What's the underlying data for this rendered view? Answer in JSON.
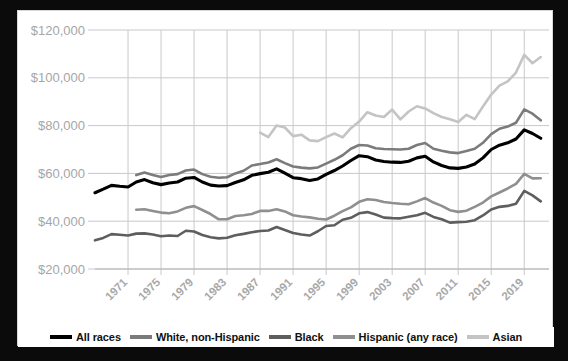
{
  "theme": {
    "page_background": "#0b0b0b",
    "card_background": "#ffffff",
    "grid_color": "#c9c9c9",
    "axis_label_color": "#a6a6a6"
  },
  "legend": {
    "position": "bottom",
    "items": [
      {
        "label": "All races",
        "color": "#000000",
        "swatch": "legend-swatch-all-races"
      },
      {
        "label": "White, non-Hispanic",
        "color": "#7b7b7b",
        "swatch": "legend-swatch-white"
      },
      {
        "label": "Black",
        "color": "#5e5e5e",
        "swatch": "legend-swatch-black"
      },
      {
        "label": "Hispanic (any race)",
        "color": "#8f8f8f",
        "swatch": "legend-swatch-hispanic"
      },
      {
        "label": "Asian",
        "color": "#c4c4c4",
        "swatch": "legend-swatch-asian"
      }
    ]
  },
  "chart_data": {
    "type": "line",
    "title": "",
    "subtitle": "",
    "xlabel": "",
    "ylabel": "",
    "grid": true,
    "legend_position": "bottom",
    "xlim": [
      1967,
      2022
    ],
    "ylim": [
      20000,
      120000
    ],
    "ytick_labels": [
      "$120,000",
      "$100,000",
      "$80,000",
      "$60,000",
      "$40,000",
      "$20,000"
    ],
    "ytick_values": [
      120000,
      100000,
      80000,
      60000,
      40000,
      20000
    ],
    "xtick_labels": [
      "1971",
      "1975",
      "1979",
      "1983",
      "1987",
      "1991",
      "1995",
      "1999",
      "2003",
      "2007",
      "2011",
      "2015",
      "2019"
    ],
    "xtick_values": [
      1971,
      1975,
      1979,
      1983,
      1987,
      1991,
      1995,
      1999,
      2003,
      2007,
      2011,
      2015,
      2019
    ],
    "series": [
      {
        "name": "All races",
        "color": "#000000",
        "width": 3.1,
        "x": [
          1967,
          1968,
          1969,
          1970,
          1971,
          1972,
          1973,
          1974,
          1975,
          1976,
          1977,
          1978,
          1979,
          1980,
          1981,
          1982,
          1983,
          1984,
          1985,
          1986,
          1987,
          1988,
          1989,
          1990,
          1991,
          1992,
          1993,
          1994,
          1995,
          1996,
          1997,
          1998,
          1999,
          2000,
          2001,
          2002,
          2003,
          2004,
          2005,
          2006,
          2007,
          2008,
          2009,
          2010,
          2011,
          2012,
          2013,
          2014,
          2015,
          2016,
          2017,
          2018,
          2019,
          2020,
          2021
        ],
        "values": [
          51900,
          53400,
          55000,
          54600,
          54300,
          56400,
          57400,
          56100,
          55300,
          56000,
          56400,
          58000,
          58300,
          56400,
          55100,
          54700,
          54900,
          56200,
          57300,
          59200,
          59900,
          60500,
          61900,
          60100,
          58200,
          57800,
          57000,
          57700,
          59600,
          61200,
          63100,
          65400,
          67400,
          67000,
          65600,
          65000,
          64700,
          64600,
          65100,
          66500,
          67200,
          64800,
          63300,
          62300,
          62100,
          62700,
          63900,
          66500,
          70000,
          71800,
          72800,
          74400,
          78200,
          76700,
          74700
        ]
      },
      {
        "name": "White, non-Hispanic",
        "color": "#7b7b7b",
        "width": 2.6,
        "x": [
          1972,
          1973,
          1974,
          1975,
          1976,
          1977,
          1978,
          1979,
          1980,
          1981,
          1982,
          1983,
          1984,
          1985,
          1986,
          1987,
          1988,
          1989,
          1990,
          1991,
          1992,
          1993,
          1994,
          1995,
          1996,
          1997,
          1998,
          1999,
          2000,
          2001,
          2002,
          2003,
          2004,
          2005,
          2006,
          2007,
          2008,
          2009,
          2010,
          2011,
          2012,
          2013,
          2014,
          2015,
          2016,
          2017,
          2018,
          2019,
          2020,
          2021
        ],
        "values": [
          59300,
          60400,
          59300,
          58500,
          59300,
          59700,
          61200,
          61600,
          59700,
          58600,
          58200,
          58400,
          60000,
          61100,
          63300,
          63900,
          64600,
          65900,
          64300,
          62900,
          62400,
          62100,
          62500,
          64100,
          65700,
          67600,
          70300,
          71900,
          71700,
          70500,
          70200,
          70100,
          70000,
          70300,
          71900,
          72700,
          70300,
          69500,
          68800,
          68500,
          69400,
          70300,
          72800,
          76400,
          78700,
          79600,
          81200,
          86800,
          85000,
          82200
        ]
      },
      {
        "name": "Black",
        "color": "#5e5e5e",
        "width": 2.6,
        "x": [
          1967,
          1968,
          1969,
          1970,
          1971,
          1972,
          1973,
          1974,
          1975,
          1976,
          1977,
          1978,
          1979,
          1980,
          1981,
          1982,
          1983,
          1984,
          1985,
          1986,
          1987,
          1988,
          1989,
          1990,
          1991,
          1992,
          1993,
          1994,
          1995,
          1996,
          1997,
          1998,
          1999,
          2000,
          2001,
          2002,
          2003,
          2004,
          2005,
          2006,
          2007,
          2008,
          2009,
          2010,
          2011,
          2012,
          2013,
          2014,
          2015,
          2016,
          2017,
          2018,
          2019,
          2020,
          2021
        ],
        "values": [
          32000,
          33000,
          34600,
          34300,
          34000,
          34800,
          34900,
          34400,
          33700,
          34000,
          33800,
          36000,
          35700,
          34200,
          33300,
          32800,
          33100,
          34100,
          34700,
          35400,
          35900,
          36100,
          37600,
          36300,
          35100,
          34400,
          34000,
          35800,
          38000,
          38300,
          40600,
          41400,
          43300,
          43800,
          42800,
          41500,
          41300,
          41200,
          41900,
          42500,
          43500,
          41800,
          40800,
          39400,
          39600,
          39800,
          40400,
          42400,
          44900,
          46000,
          46400,
          47300,
          52700,
          50800,
          48300
        ]
      },
      {
        "name": "Hispanic (any race)",
        "color": "#8f8f8f",
        "width": 2.6,
        "x": [
          1972,
          1973,
          1974,
          1975,
          1976,
          1977,
          1978,
          1979,
          1980,
          1981,
          1982,
          1983,
          1984,
          1985,
          1986,
          1987,
          1988,
          1989,
          1990,
          1991,
          1992,
          1993,
          1994,
          1995,
          1996,
          1997,
          1998,
          1999,
          2000,
          2001,
          2002,
          2003,
          2004,
          2005,
          2006,
          2007,
          2008,
          2009,
          2010,
          2011,
          2012,
          2013,
          2014,
          2015,
          2016,
          2017,
          2018,
          2019,
          2020,
          2021
        ],
        "values": [
          44800,
          45000,
          44300,
          43600,
          43300,
          44100,
          45600,
          46300,
          44700,
          43000,
          40800,
          40800,
          42200,
          42500,
          43000,
          44300,
          44300,
          45000,
          44100,
          42500,
          42000,
          41600,
          41000,
          40700,
          42300,
          44200,
          45800,
          48100,
          49200,
          48900,
          48000,
          47600,
          47300,
          47100,
          48300,
          49700,
          47800,
          46400,
          44600,
          43900,
          44400,
          46000,
          47800,
          50400,
          52000,
          53700,
          55600,
          59800,
          57900,
          57980
        ]
      },
      {
        "name": "Asian",
        "color": "#c4c4c4",
        "width": 2.6,
        "x": [
          1987,
          1988,
          1989,
          1990,
          1991,
          1992,
          1993,
          1994,
          1995,
          1996,
          1997,
          1998,
          1999,
          2000,
          2001,
          2002,
          2003,
          2004,
          2005,
          2006,
          2007,
          2008,
          2009,
          2010,
          2011,
          2012,
          2013,
          2014,
          2015,
          2016,
          2017,
          2018,
          2019,
          2020,
          2021
        ],
        "values": [
          77100,
          75200,
          80000,
          79200,
          75600,
          76200,
          73800,
          73500,
          75200,
          76700,
          75100,
          78900,
          81700,
          85600,
          84200,
          83600,
          86700,
          82600,
          85900,
          88100,
          87200,
          85200,
          83600,
          82700,
          81500,
          84500,
          82700,
          88000,
          93000,
          96700,
          98500,
          102200,
          109600,
          106100,
          108700
        ]
      }
    ]
  }
}
